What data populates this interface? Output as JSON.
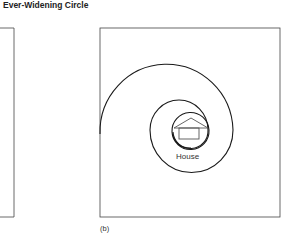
{
  "title": "Ever-Widening Circle",
  "panel_b": {
    "caption": "(b)",
    "center_label": "House",
    "center_icon": "house-icon"
  },
  "colors": {
    "stroke": "#1a1a1a",
    "icon_stroke": "#555555",
    "background": "#ffffff"
  }
}
